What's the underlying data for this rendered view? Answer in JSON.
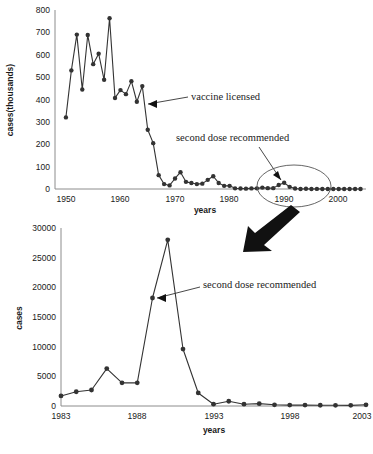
{
  "chart_data": [
    {
      "id": "top",
      "type": "line",
      "title": "",
      "xlabel": "years",
      "ylabel": "cases(thousands)",
      "xlim": [
        1948,
        2005
      ],
      "ylim": [
        0,
        800
      ],
      "xticks": [
        1950,
        1960,
        1970,
        1980,
        1990,
        2000
      ],
      "yticks": [
        0,
        100,
        200,
        300,
        400,
        500,
        600,
        700,
        800
      ],
      "grid": false,
      "legend": "none",
      "x": [
        1950,
        1951,
        1952,
        1953,
        1954,
        1955,
        1956,
        1957,
        1958,
        1959,
        1960,
        1961,
        1962,
        1963,
        1964,
        1965,
        1966,
        1967,
        1968,
        1969,
        1970,
        1971,
        1972,
        1973,
        1974,
        1975,
        1976,
        1977,
        1978,
        1979,
        1980,
        1981,
        1982,
        1983,
        1984,
        1985,
        1986,
        1987,
        1988,
        1989,
        1990,
        1991,
        1992,
        1993,
        1994,
        1995,
        1996,
        1997,
        1998,
        1999,
        2000,
        2001,
        2002,
        2003,
        2004
      ],
      "values": [
        320,
        530,
        690,
        445,
        688,
        558,
        605,
        488,
        763,
        407,
        442,
        424,
        482,
        390,
        460,
        265,
        205,
        62,
        22,
        16,
        47,
        75,
        32,
        27,
        22,
        24,
        41,
        57,
        27,
        14,
        14,
        3,
        2,
        1.5,
        2.6,
        2.8,
        6.3,
        3.9,
        3.9,
        18.2,
        27.8,
        9.6,
        2.2,
        0.3,
        1,
        0.3,
        0.5,
        0.1,
        0.1,
        0.1,
        0.09,
        0.1,
        0.04,
        0.06,
        0.04
      ],
      "annotations": [
        {
          "text": "vaccine licensed",
          "points_to_year": 1964,
          "points_to_value": 390
        },
        {
          "text": "second dose recommended",
          "points_to_year": 1989,
          "points_to_value": 18
        }
      ],
      "highlight_ellipse": {
        "from_year": 1985,
        "to_year": 1996
      }
    },
    {
      "id": "bottom",
      "type": "line",
      "title": "",
      "xlabel": "years",
      "ylabel": "cases",
      "xlim": [
        1983,
        2003
      ],
      "ylim": [
        0,
        30000
      ],
      "xticks": [
        1983,
        1988,
        1993,
        1998,
        2003
      ],
      "yticks": [
        0,
        5000,
        10000,
        15000,
        20000,
        25000,
        30000
      ],
      "grid": false,
      "legend": "none",
      "x": [
        1983,
        1984,
        1985,
        1986,
        1987,
        1988,
        1989,
        1990,
        1991,
        1992,
        1993,
        1994,
        1995,
        1996,
        1997,
        1998,
        1999,
        2000,
        2001,
        2002,
        2003
      ],
      "values": [
        1700,
        2400,
        2700,
        6300,
        3900,
        3900,
        18200,
        28000,
        9600,
        2200,
        300,
        800,
        300,
        400,
        200,
        150,
        150,
        130,
        120,
        110,
        200
      ],
      "annotations": [
        {
          "text": "second dose recommended",
          "points_to_year": 1989,
          "points_to_value": 18200
        }
      ]
    }
  ],
  "connector": {
    "name": "zoom-arrow",
    "description": "thick arrow from highlighted ellipse on top chart down-left to bottom chart"
  }
}
